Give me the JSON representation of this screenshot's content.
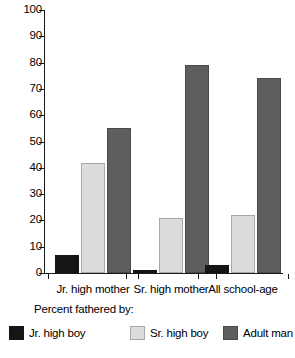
{
  "chart_data": {
    "type": "bar",
    "title": "",
    "xlabel": "",
    "ylabel": "",
    "ylim": [
      0,
      100
    ],
    "yticks": [
      0,
      10,
      20,
      30,
      40,
      50,
      60,
      70,
      80,
      90,
      100
    ],
    "grid": false,
    "legend_position": "bottom",
    "legend_title": "Percent fathered by:",
    "categories": [
      "Jr. high mother",
      "Sr. high mother",
      "All school-age"
    ],
    "series": [
      {
        "name": "Jr. high boy",
        "color": "#151515",
        "values": [
          7,
          1,
          3
        ]
      },
      {
        "name": "Sr. high boy",
        "color": "#dcdcdc",
        "values": [
          42,
          21,
          22
        ]
      },
      {
        "name": "Adult man",
        "color": "#5e5e5e",
        "values": [
          55,
          79,
          74
        ]
      }
    ]
  },
  "axis": {
    "y_tick_labels": [
      "0",
      "10",
      "20",
      "30",
      "40",
      "50",
      "60",
      "70",
      "80",
      "90",
      "100"
    ]
  }
}
